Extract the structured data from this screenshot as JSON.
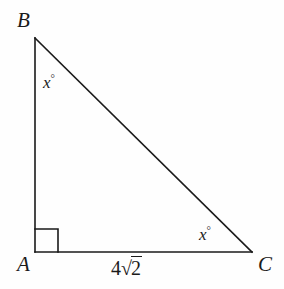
{
  "figure": {
    "type": "right-triangle-diagram",
    "background_color": "#fefefe",
    "stroke_color": "#1a1a1a",
    "text_color": "#1a1a1a"
  },
  "vertices": {
    "B": {
      "label": "B",
      "x": 35,
      "y": 38
    },
    "A": {
      "label": "A",
      "x": 35,
      "y": 252
    },
    "C": {
      "label": "C",
      "x": 252,
      "y": 252
    }
  },
  "angles": [
    {
      "at": "B",
      "label": "x",
      "unit": "°",
      "text": "x°"
    },
    {
      "at": "C",
      "label": "x",
      "unit": "°",
      "text": "x°"
    },
    {
      "at": "A",
      "label": "right-angle",
      "unit": "",
      "text": ""
    }
  ],
  "sides": [
    {
      "name": "AC",
      "label_coefficient": "4",
      "label_radical": "√",
      "label_radicand": "2",
      "text": "4√2"
    },
    {
      "name": "AB",
      "text": ""
    },
    {
      "name": "BC",
      "text": ""
    }
  ],
  "right_angle_marker": {
    "at": "A",
    "size": 22,
    "visible": true
  }
}
